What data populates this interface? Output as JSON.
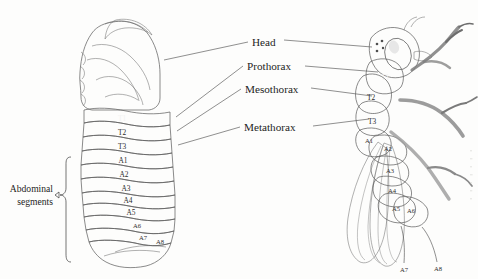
{
  "figure": {
    "background_color": "#fdfdfc"
  },
  "callouts": [
    {
      "id": "head",
      "label": "Head"
    },
    {
      "id": "prothorax",
      "label": "Prothorax"
    },
    {
      "id": "mesothorax",
      "label": "Mesothorax"
    },
    {
      "id": "metathorax",
      "label": "Metathorax"
    }
  ],
  "brace": {
    "label_line1": "Abdominal",
    "label_line2": "segments"
  },
  "larva": {
    "name": "larva-diagram",
    "thoracic_segments": [
      {
        "id": "T1",
        "label": "T1",
        "color": "#8d8d8d",
        "label_color": "#f2f2f2"
      },
      {
        "id": "T2",
        "label": "T2",
        "color": "#ababab",
        "label_color": "#2b2b2b"
      },
      {
        "id": "T3",
        "label": "T3",
        "color": "#cbcbcb",
        "label_color": "#2b2b2b"
      }
    ],
    "head_color": "#9e9e9e",
    "abdominal_segments": [
      {
        "id": "A1",
        "label": "A1"
      },
      {
        "id": "A2",
        "label": "A2"
      },
      {
        "id": "A3",
        "label": "A3"
      },
      {
        "id": "A4",
        "label": "A4"
      },
      {
        "id": "A5",
        "label": "A5"
      },
      {
        "id": "A6",
        "label": "A6"
      },
      {
        "id": "A7",
        "label": "A7"
      },
      {
        "id": "A8",
        "label": "A8"
      }
    ],
    "abdomen_color": "#ffffff"
  },
  "adult": {
    "name": "adult-fly-diagram",
    "thoracic_segments": [
      {
        "id": "T1",
        "label": "T1",
        "color": "#8d8d8d",
        "label_color": "#f2f2f2"
      },
      {
        "id": "T2",
        "label": "T2",
        "color": "#a9a9a9",
        "label_color": "#2f2f2f"
      },
      {
        "id": "T3",
        "label": "T3",
        "color": "#c8c8c8",
        "label_color": "#2f2f2f"
      }
    ],
    "abdominal_segments": [
      {
        "id": "A1",
        "label": "A1"
      },
      {
        "id": "A2",
        "label": "A2"
      },
      {
        "id": "A3",
        "label": "A3"
      },
      {
        "id": "A4",
        "label": "A4"
      },
      {
        "id": "A5",
        "label": "A5"
      },
      {
        "id": "A6",
        "label": "A6"
      },
      {
        "id": "A7",
        "label": "A7"
      },
      {
        "id": "A8",
        "label": "A8"
      }
    ],
    "body_color": "#b4b4b4",
    "wing_color": "#e3e3e3",
    "eye_color": "#9a9a9a"
  }
}
